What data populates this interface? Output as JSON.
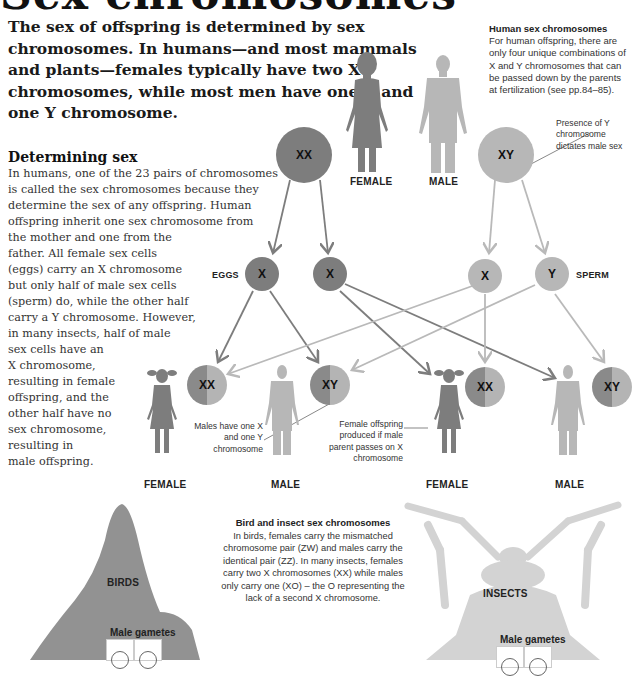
{
  "page": {
    "title": "Sex chromosomes",
    "intro": "The sex of offspring is determined by sex chromosomes. In humans—and most mammals and plants—females typically have two X chromosomes, while most men have one X and one Y chromosome."
  },
  "sidebar_note": {
    "heading": "Human sex chromosomes",
    "body": "For human offspring, there are only four unique combinations of X and Y chromosomes that can be passed down by the parents at fertilization (see pp.84–85)."
  },
  "determining_sex": {
    "heading": "Determining sex",
    "lines": [
      "In humans, one of the 23 pairs of chromosomes",
      "is called the sex chromosomes because they",
      "determine the sex of any offspring. Human",
      "offspring inherit one sex chromosome from",
      "the mother and one from the",
      "father. All female sex cells",
      "(eggs) carry an X chromosome",
      "but only half of male sex cells",
      "(sperm) do, while the other half",
      "carry a Y chromosome. However,",
      "in many insects, half of male",
      "sex cells have an",
      "X chromosome,",
      "resulting in female",
      "offspring, and the",
      "other half have no",
      "sex chromosome,",
      "resulting in",
      "male offspring."
    ]
  },
  "diagram": {
    "parents": {
      "female_label": "FEMALE",
      "male_label": "MALE",
      "female_chromosomes": "XX",
      "male_chromosomes": "XY"
    },
    "gametes": {
      "eggs_label": "EGGS",
      "sperm_label": "SPERM",
      "egg1": "X",
      "egg2": "X",
      "sperm1": "X",
      "sperm2": "Y"
    },
    "offspring": [
      {
        "chromosomes": "XX",
        "label": "FEMALE"
      },
      {
        "chromosomes": "XY",
        "label": "MALE"
      },
      {
        "chromosomes": "XX",
        "label": "FEMALE"
      },
      {
        "chromosomes": "XY",
        "label": "MALE"
      }
    ],
    "annotations": {
      "presence_y": "Presence of Y chromosome dictates male sex",
      "males_have": "Males have one X and one Y chromosome",
      "female_offspring": "Female offspring produced if male parent passes on X chromosome"
    },
    "colors": {
      "female_dark": "#7d7d7d",
      "male_light": "#b7b7b7",
      "arrow_dark": "#7d7d7d",
      "arrow_light": "#b9b9b9"
    }
  },
  "bird_insect": {
    "heading": "Bird and insect sex chromosomes",
    "body": "In birds, females carry the mismatched chromosome pair (ZW) and males carry the identical pair (ZZ). In many insects, females carry two X chromosomes (XX) while males only carry one (XO) – the O representing the lack of a second X chromosome.",
    "birds_label": "BIRDS",
    "insects_label": "INSECTS",
    "birds_gametes_label": "Male gametes",
    "insects_gametes_label": "Male gametes"
  }
}
